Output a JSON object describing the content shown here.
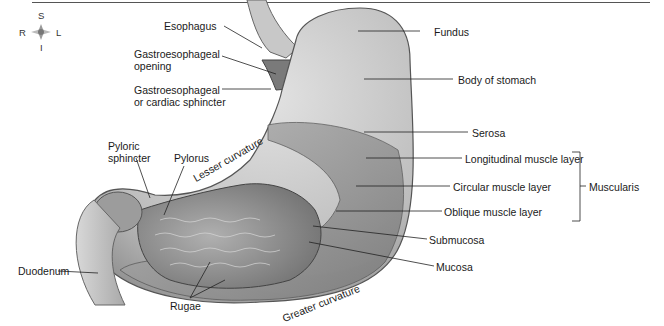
{
  "figure": {
    "type": "anatomical-diagram",
    "compass": {
      "superior": "S",
      "inferior": "I",
      "right": "R",
      "left": "L"
    },
    "labels": {
      "esophagus": "Esophagus",
      "ge_opening_line1": "Gastroesophageal",
      "ge_opening_line2": "opening",
      "ge_sphincter_line1": "Gastroesophageal",
      "ge_sphincter_line2": "or cardiac sphincter",
      "pyloric_sphincter_line1": "Pyloric",
      "pyloric_sphincter_line2": "sphincter",
      "pylorus": "Pylorus",
      "lesser_curvature": "Lesser curvature",
      "duodenum": "Duodenum",
      "rugae": "Rugae",
      "greater_curvature": "Greater curvature",
      "fundus": "Fundus",
      "body_of_stomach": "Body of stomach",
      "serosa": "Serosa",
      "longitudinal_muscle": "Longitudinal muscle layer",
      "circular_muscle": "Circular muscle layer",
      "oblique_muscle": "Oblique muscle layer",
      "muscularis": "Muscularis",
      "submucosa": "Submucosa",
      "mucosa": "Mucosa"
    },
    "colors": {
      "outer_wall": "#c9c9c9",
      "muscle": "#9a9a9a",
      "mucosa": "#8c8c8c",
      "lines": "#222222"
    }
  }
}
